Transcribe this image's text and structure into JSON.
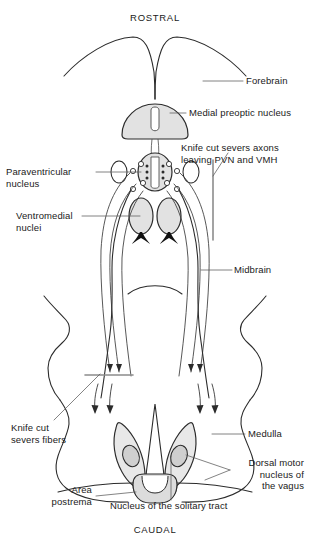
{
  "figure": {
    "orientation": {
      "rostral": "ROSTRAL",
      "caudal": "CAUDAL"
    },
    "labels": {
      "forebrain": "Forebrain",
      "medial_preoptic_nucleus": "Medial preoptic nucleus",
      "knife_cut_axons": "Knife cut severs axons\nleaving PVN and VMH",
      "paraventricular_nucleus": "Paraventricular\nnucleus",
      "ventromedial_nuclei": "Ventromedial\nnuclei",
      "midbrain": "Midbrain",
      "knife_cut_fibers": "Knife cut\nsevers fibers",
      "medulla": "Medulla",
      "dorsal_motor_nucleus_vagus": "Dorsal motor\nnucleus of\nthe vagus",
      "area_postrema": "Area\npostrema",
      "nucleus_solitary_tract": "Nucleus of the solitary tract"
    },
    "colors": {
      "outline": "#2b2b2b",
      "nucleus_fill": "#e2e2e2",
      "nucleus_fill_dark": "#cfcfcf",
      "knife_cut_line": "#8c8c8c",
      "leader_line": "#4a4a4a",
      "text": "#1a1a1a",
      "background": "#ffffff"
    }
  }
}
